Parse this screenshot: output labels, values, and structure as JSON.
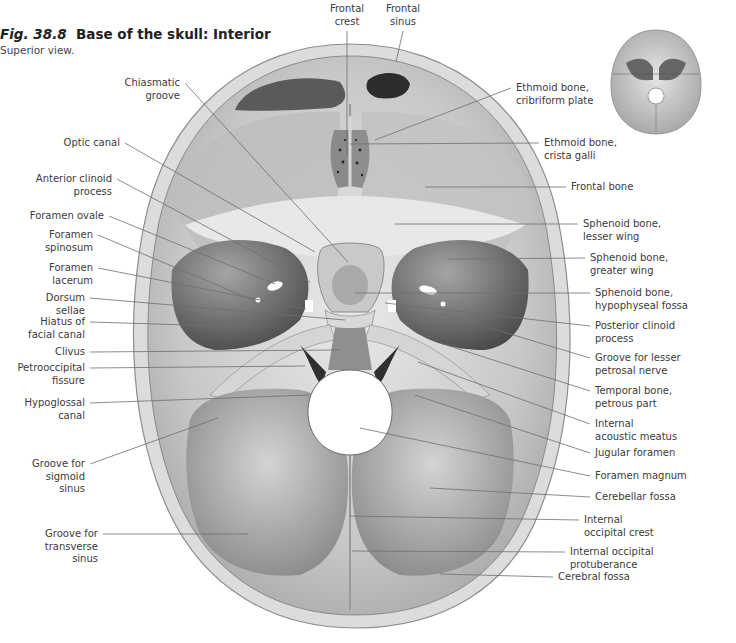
{
  "figure": {
    "number": "Fig. 38.8",
    "title": "Base of the skull: Interior",
    "subtitle": "Superior view."
  },
  "thumbnail": {
    "description": "orientation-skull-thumbnail"
  },
  "labels": {
    "top": [
      {
        "id": "frontal-crest",
        "lines": [
          "Frontal",
          "crest"
        ],
        "x": 347,
        "y": 3,
        "tx": 347,
        "ty": 155
      },
      {
        "id": "frontal-sinus",
        "lines": [
          "Frontal",
          "sinus"
        ],
        "x": 403,
        "y": 3,
        "tx": 396,
        "ty": 62
      }
    ],
    "left": [
      {
        "id": "chiasmatic-groove",
        "lines": [
          "Chiasmatic",
          "groove"
        ],
        "right": 180,
        "y": 77,
        "tx": 348,
        "ty": 262
      },
      {
        "id": "optic-canal",
        "lines": [
          "Optic canal"
        ],
        "right": 120,
        "y": 137,
        "tx": 315,
        "ty": 252
      },
      {
        "id": "anterior-clinoid-process",
        "lines": [
          "Anterior clinoid",
          "process"
        ],
        "right": 112,
        "y": 173,
        "tx": 310,
        "ty": 282
      },
      {
        "id": "foramen-ovale",
        "lines": [
          "Foramen ovale"
        ],
        "right": 104,
        "y": 210,
        "tx": 275,
        "ty": 284
      },
      {
        "id": "foramen-spinosum",
        "lines": [
          "Foramen",
          "spinosum"
        ],
        "right": 93,
        "y": 229,
        "tx": 255,
        "ty": 301
      },
      {
        "id": "foramen-lacerum",
        "lines": [
          "Foramen",
          "lacerum"
        ],
        "right": 93,
        "y": 262,
        "tx": 306,
        "ty": 309
      },
      {
        "id": "dorsum-sellae",
        "lines": [
          "Dorsum",
          "sellae"
        ],
        "right": 85,
        "y": 292,
        "tx": 345,
        "ty": 320
      },
      {
        "id": "hiatus-of-facial-canal",
        "lines": [
          "Hiatus of",
          "facial canal"
        ],
        "right": 85,
        "y": 316,
        "tx": 255,
        "ty": 327
      },
      {
        "id": "clivus",
        "lines": [
          "Clivus"
        ],
        "right": 85,
        "y": 346,
        "tx": 340,
        "ty": 350
      },
      {
        "id": "petrooccipital-fissure",
        "lines": [
          "Petrooccipital",
          "fissure"
        ],
        "right": 85,
        "y": 362,
        "tx": 305,
        "ty": 366
      },
      {
        "id": "hypoglossal-canal",
        "lines": [
          "Hypoglossal",
          "canal"
        ],
        "right": 85,
        "y": 397,
        "tx": 310,
        "ty": 395
      },
      {
        "id": "groove-for-sigmoid-sinus",
        "lines": [
          "Groove for",
          "sigmoid",
          "sinus"
        ],
        "right": 85,
        "y": 458,
        "tx": 218,
        "ty": 418
      },
      {
        "id": "groove-for-transverse-sinus",
        "lines": [
          "Groove for",
          "transverse",
          "sinus"
        ],
        "right": 98,
        "y": 528,
        "tx": 248,
        "ty": 534
      }
    ],
    "right": [
      {
        "id": "ethmoid-cribriform-plate",
        "lines": [
          "Ethmoid bone,",
          "cribriform plate"
        ],
        "x": 516,
        "y": 82,
        "tx": 375,
        "ty": 140
      },
      {
        "id": "ethmoid-crista-galli",
        "lines": [
          "Ethmoid bone,",
          "crista galli"
        ],
        "x": 544,
        "y": 137,
        "tx": 350,
        "ty": 144
      },
      {
        "id": "frontal-bone",
        "lines": [
          "Frontal bone"
        ],
        "x": 571,
        "y": 181,
        "tx": 425,
        "ty": 187
      },
      {
        "id": "sphenoid-lesser-wing",
        "lines": [
          "Sphenoid bone,",
          "lesser wing"
        ],
        "x": 583,
        "y": 218,
        "tx": 395,
        "ty": 224
      },
      {
        "id": "sphenoid-greater-wing",
        "lines": [
          "Sphenoid bone,",
          "greater wing"
        ],
        "x": 590,
        "y": 252,
        "tx": 448,
        "ty": 259
      },
      {
        "id": "sphenoid-hypophyseal-fossa",
        "lines": [
          "Sphenoid bone,",
          "hypophyseal fossa"
        ],
        "x": 595,
        "y": 287,
        "tx": 355,
        "ty": 293
      },
      {
        "id": "posterior-clinoid-process",
        "lines": [
          "Posterior clinoid",
          "process"
        ],
        "x": 595,
        "y": 320,
        "tx": 385,
        "ty": 303
      },
      {
        "id": "groove-for-lesser-petrosal-nerve",
        "lines": [
          "Groove for lesser",
          "petrosal nerve"
        ],
        "x": 595,
        "y": 352,
        "tx": 440,
        "ty": 313
      },
      {
        "id": "temporal-petrous-part",
        "lines": [
          "Temporal bone,",
          "petrous part"
        ],
        "x": 595,
        "y": 385,
        "tx": 440,
        "ty": 343
      },
      {
        "id": "internal-acoustic-meatus",
        "lines": [
          "Internal",
          "acoustic meatus"
        ],
        "x": 595,
        "y": 418,
        "tx": 418,
        "ty": 362
      },
      {
        "id": "jugular-foramen",
        "lines": [
          "Jugular foramen"
        ],
        "x": 595,
        "y": 447,
        "tx": 415,
        "ty": 395
      },
      {
        "id": "foramen-magnum",
        "lines": [
          "Foramen magnum"
        ],
        "x": 595,
        "y": 470,
        "tx": 360,
        "ty": 428
      },
      {
        "id": "cerebellar-fossa",
        "lines": [
          "Cerebellar fossa"
        ],
        "x": 595,
        "y": 491,
        "tx": 430,
        "ty": 488
      },
      {
        "id": "internal-occipital-crest",
        "lines": [
          "Internal",
          "occipital crest"
        ],
        "x": 584,
        "y": 514,
        "tx": 350,
        "ty": 516
      },
      {
        "id": "internal-occipital-protuberance",
        "lines": [
          "Internal occipital",
          "protuberance"
        ],
        "x": 570,
        "y": 546,
        "tx": 352,
        "ty": 551
      },
      {
        "id": "cerebral-fossa",
        "lines": [
          "Cerebral fossa"
        ],
        "x": 558,
        "y": 571,
        "tx": 440,
        "ty": 574
      }
    ]
  },
  "colors": {
    "bone_light": "#e6e6e6",
    "bone_mid": "#b9b9b9",
    "bone_dark": "#6a6a6a",
    "cavity": "#3d3d3d",
    "leader": "#6e6e6e",
    "diploe": "#d9d9d9"
  }
}
